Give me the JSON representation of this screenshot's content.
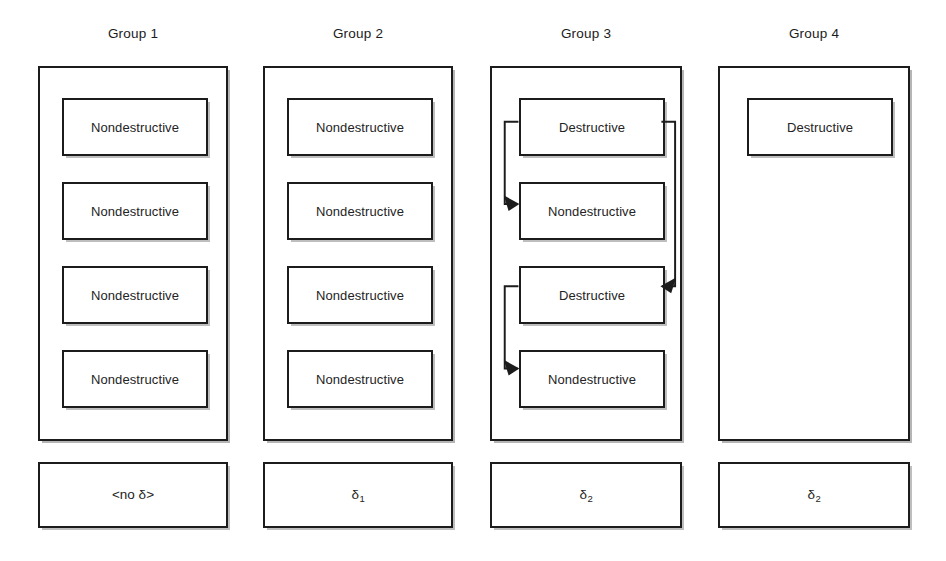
{
  "canvas": {
    "width": 946,
    "height": 561,
    "background": "#ffffff"
  },
  "style": {
    "line_color": "#1c1c1c",
    "text_color": "#242424",
    "shadow_color": "#7d7d7d"
  },
  "groups": [
    {
      "id": "group-1",
      "title": "Group 1",
      "column_left": 38,
      "column_width": 190,
      "box": {
        "left": 0,
        "top": 66,
        "width": 190,
        "height": 375
      },
      "inner_inset": {
        "x": 22,
        "y": 30,
        "width": 146,
        "height": 58,
        "gap": 26
      },
      "items": [
        {
          "label": "Nondestructive"
        },
        {
          "label": "Nondestructive"
        },
        {
          "label": "Nondestructive"
        },
        {
          "label": "Nondestructive"
        }
      ],
      "delta": {
        "text": "<no δ>",
        "sub": "",
        "width": 190
      },
      "has_arrows": false
    },
    {
      "id": "group-2",
      "title": "Group 2",
      "column_left": 263,
      "column_width": 190,
      "box": {
        "left": 0,
        "top": 66,
        "width": 190,
        "height": 375
      },
      "inner_inset": {
        "x": 22,
        "y": 30,
        "width": 146,
        "height": 58,
        "gap": 26
      },
      "items": [
        {
          "label": "Nondestructive"
        },
        {
          "label": "Nondestructive"
        },
        {
          "label": "Nondestructive"
        },
        {
          "label": "Nondestructive"
        }
      ],
      "delta": {
        "text": "δ",
        "sub": "1",
        "width": 190
      },
      "has_arrows": false
    },
    {
      "id": "group-3",
      "title": "Group 3",
      "column_left": 490,
      "column_width": 192,
      "box": {
        "left": 0,
        "top": 66,
        "width": 192,
        "height": 375
      },
      "inner_inset": {
        "x": 27,
        "y": 30,
        "width": 146,
        "height": 58,
        "gap": 26
      },
      "items": [
        {
          "label": "Destructive"
        },
        {
          "label": "Nondestructive"
        },
        {
          "label": "Destructive"
        },
        {
          "label": "Nondestructive"
        }
      ],
      "delta": {
        "text": "δ",
        "sub": "2",
        "width": 192
      },
      "has_arrows": true,
      "arrows": [
        {
          "name": "arrow-destructive1-to-nondestructive1",
          "from_item": 0,
          "to_item": 1,
          "side": "left"
        },
        {
          "name": "arrow-destructive1-to-destructive2",
          "from_item": 0,
          "to_item": 2,
          "side": "right"
        },
        {
          "name": "arrow-destructive2-to-nondestructive2",
          "from_item": 2,
          "to_item": 3,
          "side": "left"
        }
      ]
    },
    {
      "id": "group-4",
      "title": "Group 4",
      "column_left": 718,
      "column_width": 192,
      "box": {
        "left": 0,
        "top": 66,
        "width": 192,
        "height": 375
      },
      "inner_inset": {
        "x": 27,
        "y": 30,
        "width": 146,
        "height": 58,
        "gap": 26
      },
      "items": [
        {
          "label": "Destructive"
        }
      ],
      "delta": {
        "text": "δ",
        "sub": "2",
        "width": 192
      },
      "has_arrows": false
    }
  ]
}
